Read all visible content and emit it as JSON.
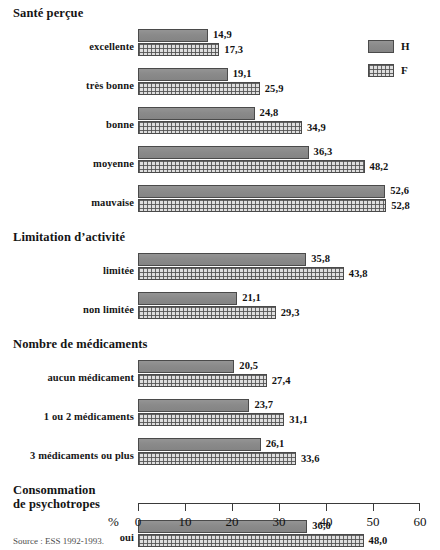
{
  "chart_data": {
    "type": "bar",
    "orientation": "horizontal",
    "title": "",
    "xlabel": "%",
    "ylabel": "",
    "xlim": [
      0,
      60
    ],
    "xticks": [
      0,
      10,
      20,
      30,
      40,
      50,
      60
    ],
    "grid": false,
    "legend_position": "top-right",
    "source": "Source : ESS 1992-1993.",
    "series": [
      {
        "name": "H",
        "key": "H",
        "color": "#8c8c8c",
        "fill": "solid"
      },
      {
        "name": "F",
        "key": "F",
        "color": "#dedede",
        "fill": "crosshatch"
      }
    ],
    "sections": [
      {
        "header": "Santé perçue",
        "categories": [
          {
            "label": "excellente",
            "H": 14.9,
            "F": 17.3,
            "H_text": "14,9",
            "F_text": "17,3"
          },
          {
            "label": "très bonne",
            "H": 19.1,
            "F": 25.9,
            "H_text": "19,1",
            "F_text": "25,9"
          },
          {
            "label": "bonne",
            "H": 24.8,
            "F": 34.9,
            "H_text": "24,8",
            "F_text": "34,9"
          },
          {
            "label": "moyenne",
            "H": 36.3,
            "F": 48.2,
            "H_text": "36,3",
            "F_text": "48,2"
          },
          {
            "label": "mauvaise",
            "H": 52.6,
            "F": 52.8,
            "H_text": "52,6",
            "F_text": "52,8"
          }
        ]
      },
      {
        "header": "Limitation d’activité",
        "categories": [
          {
            "label": "limitée",
            "H": 35.8,
            "F": 43.8,
            "H_text": "35,8",
            "F_text": "43,8"
          },
          {
            "label": "non limitée",
            "H": 21.1,
            "F": 29.3,
            "H_text": "21,1",
            "F_text": "29,3"
          }
        ]
      },
      {
        "header": "Nombre de médicaments",
        "categories": [
          {
            "label": "aucun médicament",
            "H": 20.5,
            "F": 27.4,
            "H_text": "20,5",
            "F_text": "27,4"
          },
          {
            "label": "1 ou 2 médicaments",
            "H": 23.7,
            "F": 31.1,
            "H_text": "23,7",
            "F_text": "31,1"
          },
          {
            "label": "3 médicaments ou plus",
            "H": 26.1,
            "F": 33.6,
            "H_text": "26,1",
            "F_text": "33,6"
          }
        ]
      },
      {
        "header": "Consommation\nde psychotropes",
        "categories": [
          {
            "label": "oui",
            "H": 36.0,
            "F": 48.0,
            "H_text": "36,0",
            "F_text": "48,0"
          },
          {
            "label": "non",
            "H": 21.6,
            "F": 29.1,
            "H_text": "21,6",
            "F_text": "29,1"
          }
        ]
      }
    ]
  },
  "legend": {
    "items": [
      {
        "label": "H",
        "swatch": "solid-gray-swatch"
      },
      {
        "label": "F",
        "swatch": "crosshatch-swatch"
      }
    ]
  },
  "axis": {
    "unit_label": "%",
    "tick_labels": [
      "0",
      "10",
      "20",
      "30",
      "40",
      "50",
      "60"
    ]
  },
  "footer": {
    "source": "Source : ESS 1992-1993."
  }
}
